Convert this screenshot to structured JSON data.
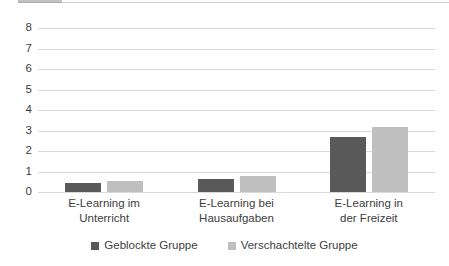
{
  "chart_data": {
    "type": "bar",
    "title": "",
    "subtitle": "",
    "xlabel": "",
    "ylabel": "",
    "ylim": [
      0,
      8
    ],
    "yticks": [
      8,
      7,
      6,
      5,
      4,
      3,
      2,
      1,
      0
    ],
    "grid": true,
    "legend_position": "bottom",
    "categories": [
      "E-Learning im Unterricht",
      "E-Learning bei Hausaufgaben",
      "E-Learning in der Freizeit"
    ],
    "category_lines": [
      [
        "E-Learning im",
        "Unterricht"
      ],
      [
        "E-Learning bei",
        "Hausaufgaben"
      ],
      [
        "E-Learning in",
        "der Freizeit"
      ]
    ],
    "series": [
      {
        "name": "Geblockte Gruppe",
        "color": "#595959",
        "values": [
          0.42,
          0.65,
          2.7
        ]
      },
      {
        "name": "Verschachtelte Gruppe",
        "color": "#bfbfbf",
        "values": [
          0.55,
          0.8,
          3.15
        ]
      }
    ]
  },
  "colors": {
    "series_dark": "#595959",
    "series_light": "#bfbfbf",
    "gridline": "#d9d9d9",
    "text": "#404040",
    "background": "#ffffff"
  }
}
